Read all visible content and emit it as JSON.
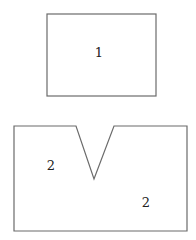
{
  "diagram": {
    "shapes": [
      {
        "id": "shape-1",
        "type": "rectangle",
        "label": "1"
      },
      {
        "id": "shape-2",
        "type": "notched-rectangle",
        "labels": [
          "2",
          "2"
        ]
      }
    ]
  },
  "colors": {
    "stroke": "#6b6b6b",
    "text": "#222222"
  }
}
